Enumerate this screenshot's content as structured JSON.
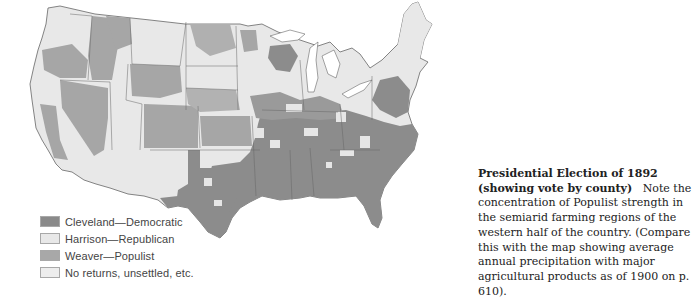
{
  "map": {
    "title": "Presidential Election of 1892 (showing vote by county)",
    "region": "Continental United States",
    "colors": {
      "democratic": "#8c8c8c",
      "republican": "#e6e6e6",
      "populist": "#a6a6a6",
      "no_returns": "#efefef",
      "border": "#555555"
    }
  },
  "legend": {
    "items": [
      {
        "label": "Cleveland—Democratic",
        "color": "#8a8a8a"
      },
      {
        "label": "Harrison—Republican",
        "color": "#e8e8e8"
      },
      {
        "label": "Weaver—Populist",
        "color": "#a8a8a8"
      },
      {
        "label": "No returns, unsettled, etc.",
        "color": "#ededed"
      }
    ]
  },
  "caption": {
    "title": "Presidential Election of 1892 (showing vote by county)",
    "body": "Note the concentration of Populist strength in the semiarid farming regions of the western half of the country. (Compare this with the map showing average annual precipitation with major agricultural products as of 1900 on p. 610)."
  }
}
